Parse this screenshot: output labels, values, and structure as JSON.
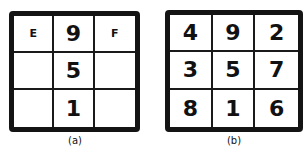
{
  "figures": [
    {
      "caption": "(a)",
      "cells": [
        "E",
        "9",
        "F",
        "",
        "5",
        "",
        "",
        "1",
        ""
      ]
    },
    {
      "caption": "(b)",
      "cells": [
        "4",
        "9",
        "2",
        "3",
        "5",
        "7",
        "8",
        "1",
        "6"
      ]
    }
  ]
}
